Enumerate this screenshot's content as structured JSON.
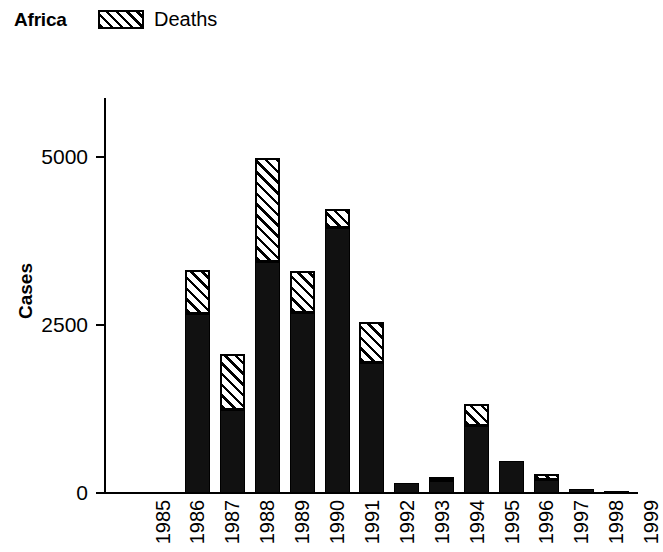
{
  "header": {
    "region_title": "Africa",
    "legend": [
      {
        "label": "Deaths",
        "pattern": "diagonal-hatch",
        "color": "#000000"
      }
    ]
  },
  "axes": {
    "y_title": "Cases",
    "y_ticks": [
      "0",
      "2500",
      "5000"
    ],
    "y_tick_values": [
      0,
      2500,
      5000
    ],
    "y_min": 0,
    "y_max": 5200,
    "x_ticks": [
      "1985",
      "1986",
      "1987",
      "1988",
      "1989",
      "1990",
      "1991",
      "1992",
      "1993",
      "1994",
      "1995",
      "1996",
      "1997",
      "1998",
      "1999"
    ]
  },
  "chart_data": {
    "type": "bar",
    "subtype": "stacked",
    "title": "Africa",
    "xlabel": "",
    "ylabel": "Cases",
    "ylim": [
      0,
      5200
    ],
    "grid": false,
    "legend_position": "top",
    "categories": [
      "1985",
      "1986",
      "1987",
      "1988",
      "1989",
      "1990",
      "1991",
      "1992",
      "1993",
      "1994",
      "1995",
      "1996",
      "1997",
      "1998",
      "1999"
    ],
    "series": [
      {
        "name": "Cases",
        "fill": "solid-black",
        "color": "#111111",
        "values": [
          0,
          2660,
          1240,
          3440,
          2680,
          3950,
          1930,
          150,
          180,
          1000,
          480,
          190,
          60,
          25,
          0
        ]
      },
      {
        "name": "Deaths",
        "fill": "diagonal-hatch",
        "color": "#000000",
        "values": [
          0,
          660,
          830,
          1540,
          630,
          280,
          610,
          0,
          60,
          320,
          0,
          100,
          0,
          0,
          0
        ]
      }
    ],
    "totals": [
      0,
      3320,
      2070,
      4980,
      3310,
      4230,
      2540,
      150,
      240,
      1320,
      480,
      290,
      60,
      25,
      0
    ]
  }
}
